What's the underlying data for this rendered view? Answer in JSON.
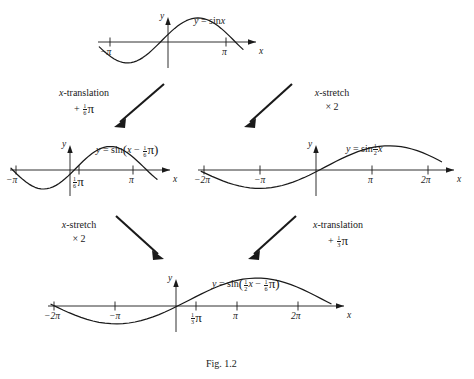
{
  "figure": {
    "caption": "Fig. 1.2",
    "ink_color": "#1a1a1a",
    "background": "#ffffff"
  },
  "graphs": [
    {
      "id": "graph-top",
      "equation_plain": "y = sin x",
      "equation_parts": {
        "lhs": "y =",
        "fn": "sin",
        "arg": "x"
      },
      "amplitude": 1,
      "period_pi": 2,
      "x_scale": 1,
      "x_shift_pi": 0,
      "axis_labels": {
        "y": "y",
        "x": "x"
      },
      "x_ticks": [
        {
          "label_pre": "−",
          "label_main": "π",
          "value_pi": -1
        },
        {
          "label_pre": "",
          "label_main": "π",
          "value_pi": 1
        }
      ],
      "domain_pi": [
        -1.15,
        1.15
      ]
    },
    {
      "id": "graph-mid-left",
      "equation_plain": "y = sin(x − 1/6 π)",
      "equation_parts": {
        "lhs": "y =",
        "fn": "sin",
        "arg": "x − ⅙π"
      },
      "amplitude": 1,
      "period_pi": 2,
      "x_scale": 1,
      "x_shift_pi": 0.1667,
      "axis_labels": {
        "y": "y",
        "x": "x"
      },
      "x_ticks": [
        {
          "label_pre": "−",
          "label_main": "π",
          "value_pi": -1
        },
        {
          "label_pre": "",
          "label_main": "⅙π",
          "value_pi": 0.1667
        },
        {
          "label_pre": "",
          "label_main": "π",
          "value_pi": 1
        }
      ],
      "domain_pi": [
        -1.15,
        1.2
      ]
    },
    {
      "id": "graph-mid-right",
      "equation_plain": "y = sin 1/2 x",
      "equation_parts": {
        "lhs": "y =",
        "fn": "sin",
        "arg": "½x"
      },
      "amplitude": 1,
      "period_pi": 4,
      "x_scale": 0.5,
      "x_shift_pi": 0,
      "axis_labels": {
        "y": "y",
        "x": "x"
      },
      "x_ticks": [
        {
          "label_pre": "−",
          "label_main": "2π",
          "value_pi": -2
        },
        {
          "label_pre": "−",
          "label_main": "π",
          "value_pi": -1
        },
        {
          "label_pre": "",
          "label_main": "π",
          "value_pi": 1
        },
        {
          "label_pre": "",
          "label_main": "2π",
          "value_pi": 2
        }
      ],
      "domain_pi": [
        -2.05,
        2.15
      ]
    },
    {
      "id": "graph-bottom",
      "equation_plain": "y = sin(1/2 x − 1/6 π)",
      "equation_parts": {
        "lhs": "y =",
        "fn": "sin",
        "arg": "½x − ⅙π"
      },
      "amplitude": 1,
      "period_pi": 4,
      "x_scale": 0.5,
      "x_shift_pi": 0.3333,
      "axis_labels": {
        "y": "y",
        "x": "x"
      },
      "x_ticks": [
        {
          "label_pre": "−",
          "label_main": "2π",
          "value_pi": -2
        },
        {
          "label_pre": "−",
          "label_main": "π",
          "value_pi": -1
        },
        {
          "label_pre": "",
          "label_main": "⅓π",
          "value_pi": 0.3333
        },
        {
          "label_pre": "",
          "label_main": "π",
          "value_pi": 1
        },
        {
          "label_pre": "",
          "label_main": "2π",
          "value_pi": 2
        }
      ],
      "domain_pi": [
        -2.05,
        2.45
      ]
    }
  ],
  "operations": [
    {
      "id": "op-top-left",
      "line1": "x-translation",
      "line2_plain": "+ 1/6 π",
      "line2_sign": "+",
      "line2_num": "1",
      "line2_den": "6",
      "line2_symbol": "π",
      "kind": "translation",
      "from": "graph-top",
      "to": "graph-mid-left"
    },
    {
      "id": "op-top-right",
      "line1": "x-stretch",
      "line2_plain": "× 2",
      "line2_sign": "×",
      "line2_num": "",
      "line2_den": "",
      "line2_symbol": "2",
      "kind": "stretch",
      "from": "graph-top",
      "to": "graph-mid-right"
    },
    {
      "id": "op-bottom-left",
      "line1": "x-stretch",
      "line2_plain": "× 2",
      "line2_sign": "×",
      "line2_num": "",
      "line2_den": "",
      "line2_symbol": "2",
      "kind": "stretch",
      "from": "graph-mid-left",
      "to": "graph-bottom"
    },
    {
      "id": "op-bottom-right",
      "line1": "x-translation",
      "line2_plain": "+ 1/3 π",
      "line2_sign": "+",
      "line2_num": "1",
      "line2_den": "3",
      "line2_symbol": "π",
      "kind": "translation",
      "from": "graph-mid-right",
      "to": "graph-bottom"
    }
  ]
}
